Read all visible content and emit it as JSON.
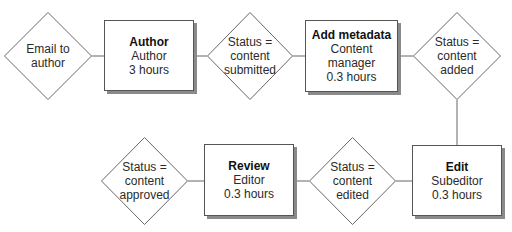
{
  "diagram": {
    "type": "workflow",
    "colors": {
      "stroke": "#555555",
      "shadow": "#8a8a8a",
      "fill": "#ffffff",
      "text": "#1a1a1a"
    },
    "nodes": [
      {
        "id": "email",
        "shape": "diamond",
        "lines": [
          "Email to",
          "author"
        ]
      },
      {
        "id": "author",
        "shape": "box",
        "title": "Author",
        "role": "Author",
        "duration": "3 hours"
      },
      {
        "id": "submitted",
        "shape": "diamond",
        "lines": [
          "Status =",
          "content",
          "submitted"
        ]
      },
      {
        "id": "metadata",
        "shape": "box",
        "title": "Add metadata",
        "role": "Content manager",
        "duration": "0.3 hours"
      },
      {
        "id": "added",
        "shape": "diamond",
        "lines": [
          "Status =",
          "content",
          "added"
        ]
      },
      {
        "id": "edit",
        "shape": "box",
        "title": "Edit",
        "role": "Subeditor",
        "duration": "0.3 hours"
      },
      {
        "id": "edited",
        "shape": "diamond",
        "lines": [
          "Status =",
          "content",
          "edited"
        ]
      },
      {
        "id": "review",
        "shape": "box",
        "title": "Review",
        "role": "Editor",
        "duration": "0.3 hours"
      },
      {
        "id": "approved",
        "shape": "diamond",
        "lines": [
          "Status =",
          "content",
          "approved"
        ]
      }
    ],
    "edges": [
      [
        "email",
        "author"
      ],
      [
        "author",
        "submitted"
      ],
      [
        "submitted",
        "metadata"
      ],
      [
        "metadata",
        "added"
      ],
      [
        "added",
        "edit"
      ],
      [
        "edit",
        "edited"
      ],
      [
        "edited",
        "review"
      ],
      [
        "review",
        "approved"
      ]
    ]
  }
}
